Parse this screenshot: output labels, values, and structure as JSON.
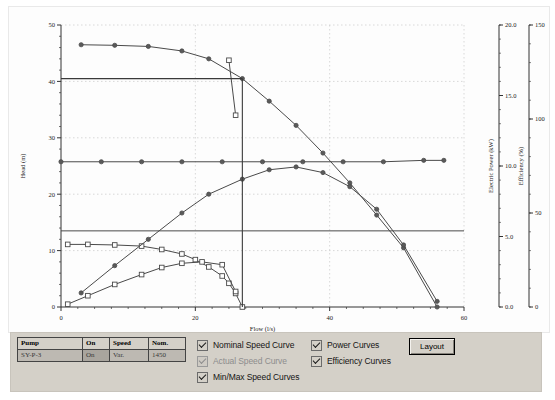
{
  "chart_data": {
    "type": "line",
    "title": "",
    "xlabel": "Flow (l/s)",
    "ylabel": "Head (m)",
    "xlim": [
      0,
      60
    ],
    "ylim": [
      0,
      50
    ],
    "xticks": [
      0,
      20,
      40,
      60
    ],
    "yticks": [
      0,
      10,
      20,
      30,
      40,
      50
    ],
    "grid": true,
    "legend_position": "below-axis",
    "secondary_axes": [
      {
        "name": "power",
        "label": "Electric Power (kW)",
        "lim": [
          0,
          20
        ],
        "ticks": [
          "0.0",
          "5.0",
          "10.0",
          "15.0",
          "20.0"
        ]
      },
      {
        "name": "efficiency",
        "label": "Efficiency (%)",
        "lim": [
          0,
          150
        ],
        "ticks": [
          "0",
          "50",
          "100",
          "150"
        ]
      }
    ],
    "operating_point": {
      "flow": 27.0,
      "head": 40.5
    },
    "series": [
      {
        "name": "Maximum head",
        "marker": "circle",
        "axis": "head",
        "x": [
          3,
          8,
          13,
          18,
          22,
          27,
          31,
          35,
          39,
          43,
          47,
          51,
          56
        ],
        "values": [
          46.5,
          46.4,
          46.2,
          45.4,
          44.0,
          40.5,
          36.5,
          32.2,
          27.3,
          22.0,
          16.3,
          10.5,
          0.0
        ]
      },
      {
        "name": "Minimum head",
        "marker": "square",
        "axis": "head",
        "x": [
          1,
          4,
          8,
          12,
          15,
          18,
          20,
          22,
          24,
          25,
          26,
          27
        ],
        "values": [
          11.1,
          11.1,
          11.0,
          10.8,
          10.2,
          9.4,
          8.4,
          7.1,
          5.5,
          4.2,
          2.4,
          0.0
        ]
      },
      {
        "name": "Nominal head",
        "marker": "none",
        "axis": "head",
        "x": [
          0,
          27,
          60
        ],
        "values": [
          13.5,
          13.5,
          13.5
        ]
      },
      {
        "name": "Efficiency",
        "marker": "circle",
        "axis": "efficiency",
        "x": [
          3,
          8,
          13,
          18,
          22,
          27,
          31,
          35,
          39,
          43,
          47,
          51,
          56
        ],
        "values": [
          7.5,
          22.0,
          36.0,
          50.0,
          60.0,
          68.0,
          73.0,
          74.5,
          71.5,
          64.0,
          52.0,
          33.0,
          3.0
        ]
      },
      {
        "name": "Actual power",
        "marker": "circle",
        "axis": "power",
        "x": [
          0,
          6,
          12,
          18,
          24,
          30,
          36,
          42,
          48,
          54,
          57
        ],
        "values": [
          10.3,
          10.3,
          10.3,
          10.3,
          10.3,
          10.3,
          10.3,
          10.3,
          10.3,
          10.4,
          10.4
        ]
      },
      {
        "name": "Minimum power",
        "marker": "square",
        "axis": "power",
        "x": [
          1,
          4,
          8,
          12,
          15,
          18,
          21,
          24,
          26
        ],
        "values": [
          0.2,
          0.8,
          1.6,
          2.3,
          2.8,
          3.1,
          3.2,
          3.0,
          1.1
        ]
      },
      {
        "name": "Nominal power marker",
        "marker": "square",
        "axis": "power",
        "x": [
          25,
          26
        ],
        "values": [
          17.5,
          13.6
        ]
      }
    ],
    "legend": [
      {
        "label": "Nominal",
        "marker": "square-filled"
      },
      {
        "label": "Actual",
        "marker": "line"
      },
      {
        "label": "Minimum",
        "marker": "square-open"
      },
      {
        "label": "Maximum",
        "marker": "diamond-open"
      }
    ]
  },
  "controls": {
    "pump_table": {
      "headers": [
        "Pump",
        "On",
        "Speed",
        "Nom."
      ],
      "rows": [
        {
          "pump": "SY-P-3",
          "on": "On",
          "speed": "Var.",
          "nom": "1450"
        }
      ]
    },
    "checkboxes": [
      {
        "label": "Nominal Speed Curve",
        "checked": true,
        "disabled": false
      },
      {
        "label": "Actual Speed Curve",
        "checked": true,
        "disabled": true
      },
      {
        "label": "Min/Max Speed Curves",
        "checked": true,
        "disabled": false
      },
      {
        "label": "Power Curves",
        "checked": true,
        "disabled": false
      },
      {
        "label": "Efficiency Curves",
        "checked": true,
        "disabled": false
      }
    ],
    "layout_button": "Layout"
  },
  "colors": {
    "curve": "#4a4a4a",
    "grid": "#c9c9c9",
    "axis": "#333333",
    "panel_bg": "#d4d0c8",
    "chart_bg": "#fdfdfd"
  }
}
